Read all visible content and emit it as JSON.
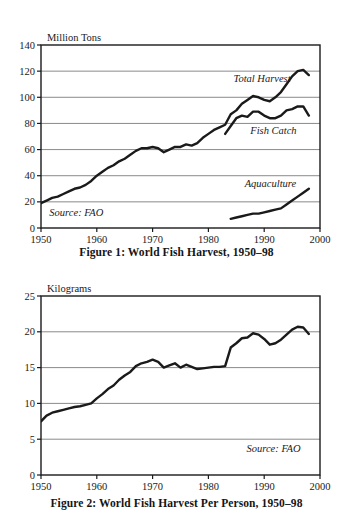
{
  "document": {
    "background_color": "#ffffff",
    "line_color": "#1a1a1a",
    "grid_color": "#7d7d7d",
    "axis_color": "#1a1a1a"
  },
  "figure1": {
    "caption": "Figure 1: World Fish Harvest, 1950–98",
    "source_note": "Source: FAO",
    "series_labels": {
      "total_harvest": "Total Harvest",
      "fish_catch": "Fish Catch",
      "aquaculture": "Aquaculture"
    }
  },
  "figure2": {
    "caption": "Figure 2: World Fish Harvest Per Person, 1950–98",
    "source_note": "Source: FAO"
  },
  "chart_data": [
    {
      "id": "figure1",
      "type": "line",
      "title": "Figure 1: World Fish Harvest, 1950–98",
      "xlabel": "",
      "ylabel": "Million Tons",
      "axis_unit_label": "Million Tons",
      "xlim": [
        1950,
        2000
      ],
      "ylim": [
        0,
        140
      ],
      "xticks": [
        1950,
        1960,
        1970,
        1980,
        1990,
        2000
      ],
      "xticklabels": [
        "1950",
        "1960",
        "1970",
        "1980",
        "1990",
        "2000"
      ],
      "yticks": [
        0,
        20,
        40,
        60,
        80,
        100,
        120,
        140
      ],
      "yticklabels": [
        "0",
        "20",
        "40",
        "60",
        "80",
        "100",
        "120",
        "140"
      ],
      "grid": true,
      "grid_axis": "y",
      "legend": "inline-annotations",
      "annotations": [
        {
          "text": "Total Harvest",
          "x": 1984.5,
          "y": 112,
          "style": "italic"
        },
        {
          "text": "Fish Catch",
          "x": 1987.5,
          "y": 72,
          "style": "italic"
        },
        {
          "text": "Aquaculture",
          "x": 1986.5,
          "y": 31,
          "style": "italic"
        },
        {
          "text": "Source: FAO",
          "x": 1951.5,
          "y": 9,
          "style": "italic"
        }
      ],
      "series": [
        {
          "name": "Total Harvest",
          "x": [
            1950,
            1951,
            1952,
            1953,
            1954,
            1955,
            1956,
            1957,
            1958,
            1959,
            1960,
            1961,
            1962,
            1963,
            1964,
            1965,
            1966,
            1967,
            1968,
            1969,
            1970,
            1971,
            1972,
            1973,
            1974,
            1975,
            1976,
            1977,
            1978,
            1979,
            1980,
            1981,
            1982,
            1983,
            1984,
            1985,
            1986,
            1987,
            1988,
            1989,
            1990,
            1991,
            1992,
            1993,
            1994,
            1995,
            1996,
            1997,
            1998
          ],
          "values": [
            19,
            21,
            23,
            24,
            26,
            28,
            30,
            31,
            33,
            36,
            40,
            43,
            46,
            48,
            51,
            53,
            56,
            59,
            61,
            61,
            62,
            61,
            58,
            60,
            62,
            62,
            64,
            63,
            65,
            69,
            72,
            75,
            77,
            79,
            87,
            90,
            95,
            98,
            101,
            100,
            98,
            97,
            100,
            104,
            110,
            116,
            120,
            121,
            117
          ]
        },
        {
          "name": "Fish Catch",
          "x": [
            1983,
            1984,
            1985,
            1986,
            1987,
            1988,
            1989,
            1990,
            1991,
            1992,
            1993,
            1994,
            1995,
            1996,
            1997,
            1998
          ],
          "values": [
            72,
            78,
            84,
            86,
            85,
            89,
            89,
            86,
            84,
            84,
            86,
            90,
            91,
            93,
            93,
            86
          ]
        },
        {
          "name": "Aquaculture",
          "x": [
            1984,
            1985,
            1986,
            1987,
            1988,
            1989,
            1990,
            1991,
            1992,
            1993,
            1994,
            1995,
            1996,
            1997,
            1998
          ],
          "values": [
            7,
            8,
            9,
            10,
            11,
            11,
            12,
            13,
            14,
            15,
            18,
            21,
            24,
            27,
            30
          ]
        }
      ]
    },
    {
      "id": "figure2",
      "type": "line",
      "title": "Figure 2: World Fish Harvest Per Person, 1950–98",
      "xlabel": "",
      "ylabel": "Kilograms",
      "axis_unit_label": "Kilograms",
      "xlim": [
        1950,
        2000
      ],
      "ylim": [
        0,
        25
      ],
      "xticks": [
        1950,
        1960,
        1970,
        1980,
        1990,
        2000
      ],
      "xticklabels": [
        "1950",
        "1960",
        "1970",
        "1980",
        "1990",
        "2000"
      ],
      "yticks": [
        0,
        5,
        10,
        15,
        20,
        25
      ],
      "yticklabels": [
        "0",
        "5",
        "10",
        "15",
        "20",
        "25"
      ],
      "grid": true,
      "grid_axis": "y",
      "annotations": [
        {
          "text": "Source: FAO",
          "x": 1996.5,
          "y": 3.2,
          "style": "italic",
          "align": "right"
        }
      ],
      "series": [
        {
          "name": "Per Person Harvest",
          "x": [
            1950,
            1951,
            1952,
            1953,
            1954,
            1955,
            1956,
            1957,
            1958,
            1959,
            1960,
            1961,
            1962,
            1963,
            1964,
            1965,
            1966,
            1967,
            1968,
            1969,
            1970,
            1971,
            1972,
            1973,
            1974,
            1975,
            1976,
            1977,
            1978,
            1979,
            1980,
            1981,
            1982,
            1983,
            1984,
            1985,
            1986,
            1987,
            1988,
            1989,
            1990,
            1991,
            1992,
            1993,
            1994,
            1995,
            1996,
            1997,
            1998
          ],
          "values": [
            7.5,
            8.3,
            8.7,
            8.9,
            9.1,
            9.3,
            9.5,
            9.6,
            9.8,
            10.0,
            10.7,
            11.3,
            12.0,
            12.5,
            13.3,
            13.9,
            14.4,
            15.2,
            15.6,
            15.8,
            16.1,
            15.8,
            15.0,
            15.3,
            15.6,
            15.0,
            15.4,
            15.1,
            14.8,
            14.9,
            15.0,
            15.1,
            15.1,
            15.2,
            17.8,
            18.4,
            19.1,
            19.2,
            19.8,
            19.6,
            19.0,
            18.2,
            18.4,
            18.9,
            19.6,
            20.3,
            20.7,
            20.6,
            19.7
          ]
        }
      ]
    }
  ]
}
